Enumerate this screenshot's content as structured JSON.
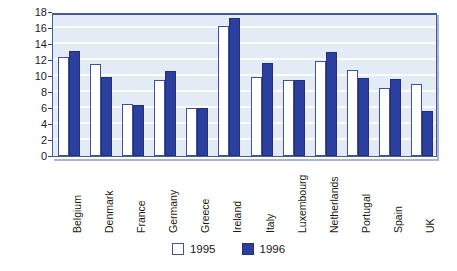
{
  "chart_data": {
    "type": "bar",
    "title": "",
    "subtitle": "",
    "xlabel": "",
    "ylabel": "Us cents/litre",
    "ylim": [
      0,
      18
    ],
    "ytick_step": 2,
    "yticks": [
      18,
      16,
      14,
      12,
      10,
      8,
      6,
      4,
      2,
      0
    ],
    "grid": true,
    "grid_orientation": "horizontal",
    "legend_position": "bottom-center",
    "categories": [
      "Belgium",
      "Denmark",
      "France",
      "Germany",
      "Greece",
      "Ireland",
      "Italy",
      "Luxembourg",
      "Netherlands",
      "Portugal",
      "Spain",
      "UK"
    ],
    "series": [
      {
        "name": "1995",
        "color": "#ffffff",
        "border_color": "#3d51a0",
        "values": [
          12.4,
          11.5,
          6.5,
          9.5,
          6.0,
          16.3,
          9.9,
          9.5,
          11.9,
          10.7,
          8.5,
          9.0
        ]
      },
      {
        "name": "1996",
        "color": "#2c3f9e",
        "border_color": "#22307a",
        "values": [
          13.1,
          9.9,
          6.35,
          10.6,
          6.05,
          17.2,
          11.6,
          9.5,
          13.0,
          9.75,
          9.6,
          5.65
        ]
      }
    ]
  },
  "legend": {
    "items": [
      {
        "label": "1995",
        "series": "s1995"
      },
      {
        "label": "1996",
        "series": "s1996"
      }
    ]
  },
  "colors": {
    "plot_background": "#e2ebf6",
    "plot_border": "#44599f",
    "gridline": "#ffffff",
    "bar_1995": "#ffffff",
    "bar_1996": "#2c3f9e",
    "text": "#1a1a1a",
    "page_background": "#ffffff"
  }
}
